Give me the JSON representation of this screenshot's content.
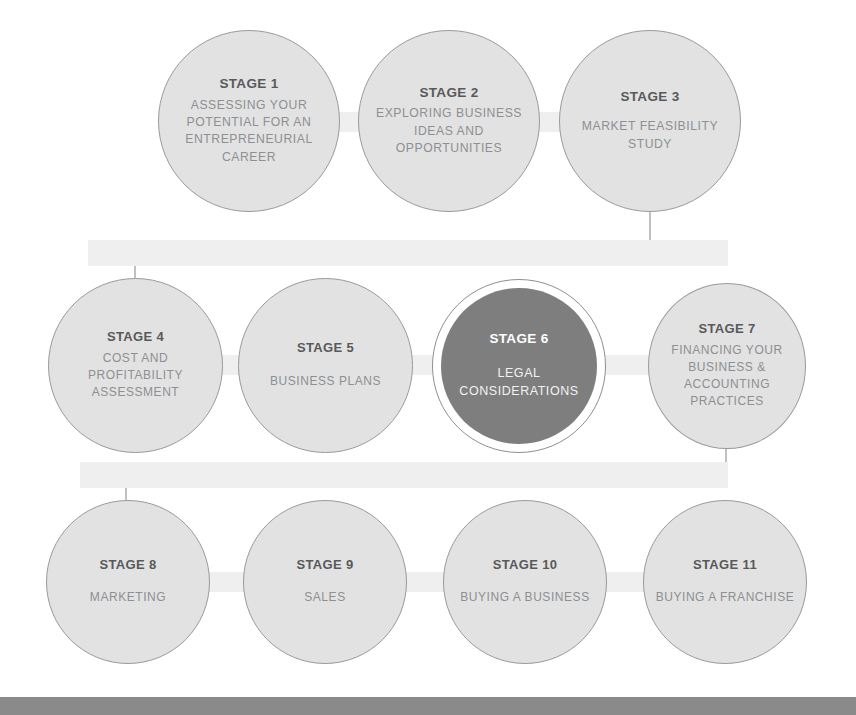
{
  "diagram": {
    "canvas": {
      "width": 856,
      "height": 715
    },
    "colors": {
      "node_fill": "#e2e2e2",
      "node_border": "#9a9a9a",
      "node_title_text": "#58595b",
      "node_desc_text": "#8d8f92",
      "highlight_fill": "#7e7e7e",
      "highlight_text": "#ffffff",
      "connector": "#a6a6a6",
      "bottom_bar": "#8a8a8a",
      "background": "#ffffff"
    },
    "rows": [
      {
        "name": "row-1",
        "stage_ids": [
          1,
          2,
          3
        ]
      },
      {
        "name": "row-2",
        "stage_ids": [
          4,
          5,
          6,
          7
        ]
      },
      {
        "name": "row-3",
        "stage_ids": [
          8,
          9,
          10,
          11
        ]
      }
    ],
    "nodes": [
      {
        "id": 1,
        "title": "STAGE 1",
        "desc": "ASSESSING YOUR POTENTIAL FOR AN ENTREPRENEURIAL CAREER",
        "highlighted": false,
        "row": 1
      },
      {
        "id": 2,
        "title": "STAGE 2",
        "desc": "EXPLORING BUSINESS IDEAS AND OPPORTUNITIES",
        "highlighted": false,
        "row": 1
      },
      {
        "id": 3,
        "title": "STAGE 3",
        "desc": "MARKET FEASIBILITY STUDY",
        "highlighted": false,
        "row": 1
      },
      {
        "id": 4,
        "title": "STAGE 4",
        "desc": "COST AND PROFITABILITY ASSESSMENT",
        "highlighted": false,
        "row": 2
      },
      {
        "id": 5,
        "title": "STAGE 5",
        "desc": "BUSINESS PLANS",
        "highlighted": false,
        "row": 2
      },
      {
        "id": 6,
        "title": "STAGE 6",
        "desc": "LEGAL CONSIDERATIONS",
        "highlighted": true,
        "row": 2
      },
      {
        "id": 7,
        "title": "STAGE 7",
        "desc": "FINANCING YOUR BUSINESS & ACCOUNTING PRACTICES",
        "highlighted": false,
        "row": 2
      },
      {
        "id": 8,
        "title": "STAGE 8",
        "desc": "MARKETING",
        "highlighted": false,
        "row": 3
      },
      {
        "id": 9,
        "title": "STAGE 9",
        "desc": "SALES",
        "highlighted": false,
        "row": 3
      },
      {
        "id": 10,
        "title": "STAGE 10",
        "desc": "BUYING A BUSINESS",
        "highlighted": false,
        "row": 3
      },
      {
        "id": 11,
        "title": "STAGE 11",
        "desc": "BUYING A FRANCHISE",
        "highlighted": false,
        "row": 3
      }
    ],
    "connectors": [
      {
        "name": "connector-1-to-2",
        "kind": "horizontal"
      },
      {
        "name": "connector-2-to-3",
        "kind": "horizontal"
      },
      {
        "name": "connector-3-to-4",
        "kind": "elbow-wrap"
      },
      {
        "name": "connector-4-to-5",
        "kind": "horizontal"
      },
      {
        "name": "connector-5-to-6",
        "kind": "horizontal"
      },
      {
        "name": "connector-6-to-7",
        "kind": "horizontal"
      },
      {
        "name": "connector-7-to-8",
        "kind": "elbow-wrap"
      },
      {
        "name": "connector-8-to-9",
        "kind": "horizontal"
      },
      {
        "name": "connector-9-to-10",
        "kind": "horizontal"
      },
      {
        "name": "connector-10-to-11",
        "kind": "horizontal"
      }
    ],
    "bottom_bar": {
      "label": "",
      "color": "#8a8a8a"
    }
  }
}
